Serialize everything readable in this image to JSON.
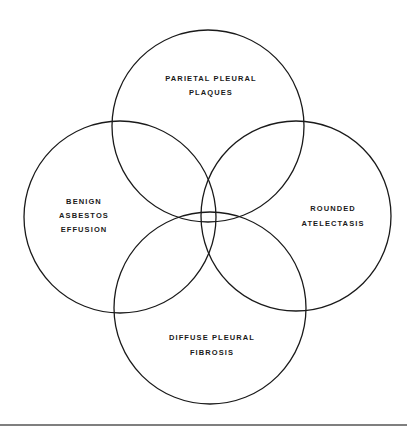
{
  "diagram": {
    "type": "venn",
    "line_color": "#1a1a1a",
    "circles": [
      {
        "name": "parietal-pleural-plaques",
        "cx": 208,
        "cy": 126,
        "r": 96,
        "label_lines": [
          "PARIETAL PLEURAL",
          "PLAQUES"
        ],
        "label_x": 211,
        "label_y": [
          81,
          95
        ]
      },
      {
        "name": "benign-asbestos-effusion",
        "cx": 120,
        "cy": 217,
        "r": 96,
        "label_lines": [
          "BENIGN",
          "ASBESTOS",
          "EFFUSION"
        ],
        "label_x": 84,
        "label_y": [
          204,
          218,
          232
        ]
      },
      {
        "name": "rounded-atelectasis",
        "cx": 296,
        "cy": 216,
        "r": 95,
        "label_lines": [
          "ROUNDED",
          "ATELECTASIS"
        ],
        "label_x": 333,
        "label_y": [
          211,
          226
        ]
      },
      {
        "name": "diffuse-pleural-fibrosis",
        "cx": 210,
        "cy": 308,
        "r": 96,
        "label_lines": [
          "DIFFUSE PLEURAL",
          "FIBROSIS"
        ],
        "label_x": 212,
        "label_y": [
          340,
          355
        ]
      }
    ],
    "rule": {
      "x1": 0,
      "x2": 407,
      "y": 425
    }
  }
}
